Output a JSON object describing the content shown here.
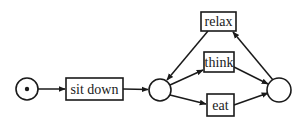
{
  "diagram": {
    "type": "petri-net",
    "colors": {
      "stroke": "#1a1a1a",
      "background": "#ffffff"
    },
    "places": [
      {
        "id": "p_start",
        "cx": 27,
        "cy": 89,
        "r": 11,
        "tokens": 1
      },
      {
        "id": "p_mid",
        "cx": 160,
        "cy": 90,
        "r": 11,
        "tokens": 0
      },
      {
        "id": "p_right",
        "cx": 279,
        "cy": 90,
        "r": 12,
        "tokens": 0
      }
    ],
    "transitions": [
      {
        "id": "t_sitdown",
        "label": "sit down",
        "x": 66,
        "y": 78,
        "w": 57,
        "h": 22
      },
      {
        "id": "t_relax",
        "label": "relax",
        "x": 201,
        "y": 12,
        "w": 35,
        "h": 19
      },
      {
        "id": "t_think",
        "label": "think",
        "x": 204,
        "y": 52,
        "w": 30,
        "h": 20
      },
      {
        "id": "t_eat",
        "label": "eat",
        "x": 207,
        "y": 94,
        "w": 27,
        "h": 22
      }
    ],
    "arcs": [
      {
        "from": "p_start",
        "to": "t_sitdown"
      },
      {
        "from": "t_sitdown",
        "to": "p_mid"
      },
      {
        "from": "p_mid",
        "to": "t_think"
      },
      {
        "from": "p_mid",
        "to": "t_eat"
      },
      {
        "from": "t_think",
        "to": "p_right"
      },
      {
        "from": "t_eat",
        "to": "p_right"
      },
      {
        "from": "p_right",
        "to": "t_relax"
      },
      {
        "from": "t_relax",
        "to": "p_mid"
      }
    ]
  },
  "labels": {
    "sit_down": "sit down",
    "relax": "relax",
    "think": "think",
    "eat": "eat"
  }
}
